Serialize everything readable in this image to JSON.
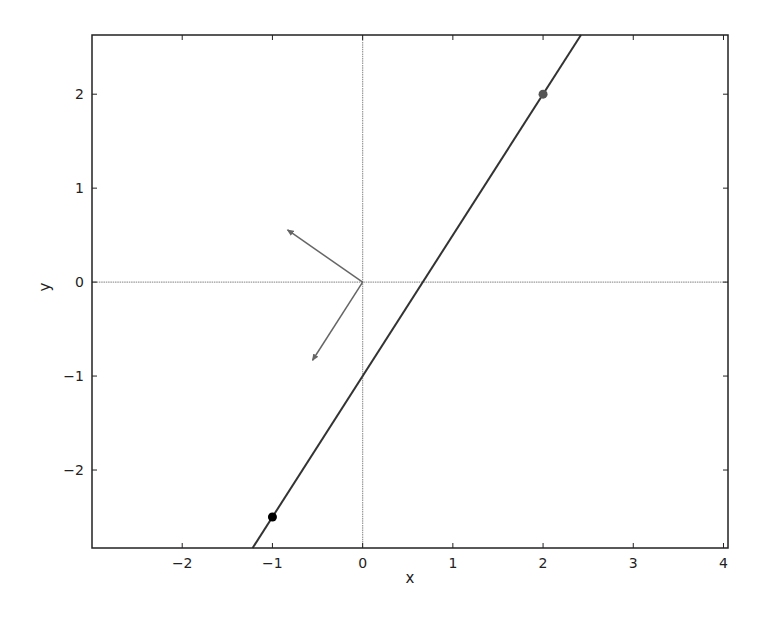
{
  "chart_data": {
    "type": "line",
    "title": "",
    "xlabel": "x",
    "ylabel": "y",
    "xlim": [
      -3.0,
      4.05
    ],
    "ylim": [
      -2.83,
      2.63
    ],
    "grid": false,
    "legend": null,
    "xticks": [
      -2,
      -1,
      0,
      1,
      2,
      3,
      4
    ],
    "yticks": [
      -2,
      -1,
      0,
      1,
      2
    ],
    "xtick_labels": [
      "−2",
      "−1",
      "0",
      "1",
      "2",
      "3",
      "4"
    ],
    "ytick_labels": [
      "−2",
      "−1",
      "0",
      "1",
      "2"
    ],
    "reference_lines": [
      {
        "orientation": "horizontal",
        "y": 0,
        "color": "#999999"
      },
      {
        "orientation": "vertical",
        "x": 0,
        "color": "#999999"
      }
    ],
    "series": [
      {
        "name": "line",
        "type": "line",
        "slope": 1.5,
        "intercept": -1.0,
        "x": [
          -1.22,
          2.42
        ],
        "y": [
          -2.83,
          2.63
        ],
        "color": "#333333"
      },
      {
        "name": "point-a",
        "type": "scatter",
        "x": [
          -1
        ],
        "y": [
          -2.5
        ],
        "color": "#000000"
      },
      {
        "name": "point-b",
        "type": "scatter",
        "x": [
          2
        ],
        "y": [
          2
        ],
        "color": "#555555"
      }
    ],
    "arrows": [
      {
        "name": "normal-vector",
        "from": [
          0,
          0
        ],
        "to": [
          -0.832,
          0.555
        ],
        "color": "#666666"
      },
      {
        "name": "direction-vector",
        "from": [
          0,
          0
        ],
        "to": [
          -0.555,
          -0.832
        ],
        "color": "#666666"
      }
    ]
  }
}
